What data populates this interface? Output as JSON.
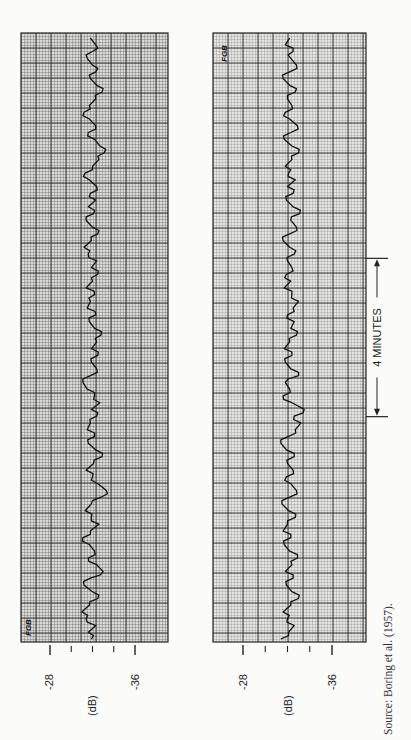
{
  "chart_data": [
    {
      "type": "line",
      "panel": "left",
      "orientation": "rotated-90",
      "title": "",
      "xlabel": "time",
      "ylabel": "(dB)",
      "ylim": [
        -26,
        -38
      ],
      "y_ticks": [
        -28,
        -30,
        -32,
        -34,
        -36
      ],
      "y_tick_labels": [
        "-28",
        "",
        "",
        "",
        "-36"
      ],
      "grid": true,
      "annotation": "FGB",
      "series": [
        {
          "name": "sound level recording 1",
          "values": [
            -31.9,
            -31.6,
            -32.3,
            -31.4,
            -31.0,
            -31.7,
            -32.5,
            -32.0,
            -31.2,
            -31.8,
            -33.0,
            -32.4,
            -31.6,
            -32.2,
            -31.7,
            -31.1,
            -31.8,
            -32.6,
            -31.9,
            -31.3,
            -31.9,
            -32.8,
            -33.3,
            -32.5,
            -32.0,
            -31.4,
            -32.1,
            -32.9,
            -32.3,
            -31.6,
            -32.2,
            -31.5,
            -31.8,
            -32.4,
            -31.9,
            -32.7,
            -32.2,
            -31.5,
            -31.1,
            -31.8,
            -32.4,
            -31.9,
            -32.5,
            -31.9,
            -32.4,
            -32.8,
            -32.2,
            -31.7,
            -32.3,
            -31.5,
            -31.8,
            -32.2,
            -31.4,
            -32.0,
            -32.5,
            -31.9,
            -32.4,
            -31.6,
            -31.2,
            -31.9,
            -32.5,
            -32.0,
            -31.4,
            -32.1,
            -31.6,
            -32.3,
            -31.8,
            -32.4,
            -31.7,
            -31.3,
            -32.0,
            -32.6,
            -33.1,
            -32.7,
            -32.2,
            -31.6,
            -32.3,
            -31.7,
            -31.2,
            -31.7,
            -32.3,
            -32.9,
            -32.4,
            -31.8,
            -32.3,
            -32.0,
            -31.5,
            -32.0,
            -32.3,
            -31.8
          ],
          "x_range_note": "time runs bottom-to-top in the rotated page"
        }
      ]
    },
    {
      "type": "line",
      "panel": "right",
      "orientation": "rotated-90",
      "title": "",
      "xlabel": "time",
      "ylabel": "(dB)",
      "ylim": [
        -26,
        -38
      ],
      "y_ticks": [
        -28,
        -30,
        -32,
        -34,
        -36
      ],
      "y_tick_labels": [
        "-28",
        "",
        "",
        "",
        "-36"
      ],
      "grid": true,
      "annotation": "FGB",
      "span_marker": {
        "label": "4 MINUTES",
        "from_fraction": 0.37,
        "to_fraction": 0.63
      },
      "series": [
        {
          "name": "sound level recording 2",
          "values": [
            -31.4,
            -32.1,
            -32.6,
            -32.0,
            -31.6,
            -32.3,
            -33.0,
            -32.4,
            -31.9,
            -32.5,
            -31.8,
            -32.4,
            -32.9,
            -32.2,
            -31.7,
            -32.3,
            -31.6,
            -32.0,
            -32.7,
            -32.1,
            -31.5,
            -32.2,
            -32.8,
            -32.3,
            -31.9,
            -32.5,
            -32.0,
            -32.6,
            -31.9,
            -31.4,
            -32.1,
            -32.7,
            -33.2,
            -32.6,
            -33.5,
            -32.4,
            -31.6,
            -32.2,
            -31.8,
            -33.0,
            -32.3,
            -31.8,
            -32.4,
            -31.7,
            -32.2,
            -32.8,
            -32.3,
            -32.6,
            -32.0,
            -32.5,
            -33.0,
            -32.4,
            -31.7,
            -32.3,
            -31.9,
            -32.4,
            -32.0,
            -32.6,
            -32.2,
            -31.6,
            -32.2,
            -32.8,
            -32.3,
            -33.1,
            -32.5,
            -31.9,
            -32.5,
            -32.0,
            -32.7,
            -32.1,
            -31.8,
            -32.4,
            -33.0,
            -32.4,
            -31.7,
            -32.3,
            -32.9,
            -32.2,
            -31.8,
            -32.4,
            -32.0,
            -32.7,
            -32.2,
            -31.6,
            -32.2,
            -32.8,
            -32.3,
            -32.5,
            -31.8,
            -32.2
          ]
        }
      ]
    }
  ],
  "labels": {
    "left_tick_28": "-28",
    "left_tick_36": "-36",
    "left_unit": "(dB)",
    "right_tick_28": "-28",
    "right_tick_36": "-36",
    "right_unit": "(dB)",
    "span_label": "4 MINUTES",
    "left_annotation": "FGB",
    "right_annotation": "FGB",
    "source": "Source:  Boring et al. (1957)."
  }
}
